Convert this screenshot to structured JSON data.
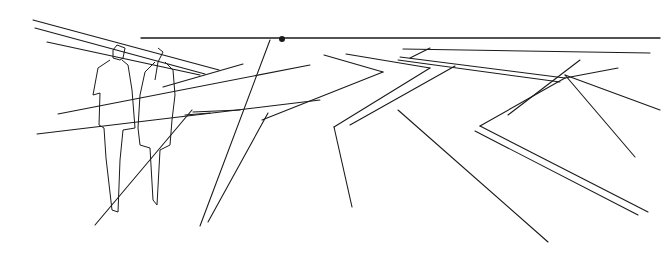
{
  "sketch": {
    "width": 671,
    "height": 262,
    "stroke_color": "#1a1a1a",
    "horizon": {
      "x1": 141,
      "y1": 38,
      "x2": 660,
      "y2": 38,
      "vanishing_point": {
        "cx": 282,
        "cy": 39,
        "r": 3
      }
    },
    "lines": [
      [
        33,
        20,
        219,
        70
      ],
      [
        35,
        28,
        205,
        74
      ],
      [
        47,
        42,
        200,
        75
      ],
      [
        58,
        114,
        310,
        65
      ],
      [
        37,
        134,
        320,
        100
      ],
      [
        95,
        225,
        192,
        110
      ],
      [
        193,
        112,
        240,
        110
      ],
      [
        185,
        115,
        210,
        113
      ],
      [
        270,
        40,
        200,
        226
      ],
      [
        243,
        64,
        163,
        87
      ],
      [
        288,
        68,
        0,
        0
      ],
      [
        307,
        64,
        0,
        0
      ],
      [
        324,
        55,
        383,
        72
      ],
      [
        383,
        72,
        262,
        120
      ],
      [
        346,
        54,
        430,
        68
      ],
      [
        430,
        68,
        334,
        127
      ],
      [
        334,
        127,
        352,
        207
      ],
      [
        268,
        113,
        208,
        222
      ],
      [
        403,
        49,
        650,
        53
      ],
      [
        400,
        57,
        565,
        78
      ],
      [
        398,
        60,
        560,
        82
      ],
      [
        410,
        58,
        430,
        48
      ],
      [
        565,
        78,
        618,
        68
      ],
      [
        565,
        75,
        635,
        157
      ],
      [
        565,
        75,
        660,
        110
      ],
      [
        565,
        78,
        480,
        126
      ],
      [
        480,
        126,
        648,
        212
      ],
      [
        475,
        131,
        638,
        215
      ],
      [
        455,
        66,
        350,
        125
      ],
      [
        398,
        110,
        548,
        242
      ],
      [
        580,
        60,
        508,
        115
      ]
    ],
    "figures": [
      {
        "name": "man",
        "path": "M117,45 L125,48 L123,58 L120,60 L113,58 L113,50 Z M110,60 L98,68 L93,95 L100,93 L99,125 L104,128 L106,158 L112,210 L118,212 L120,160 L123,130 L135,128 L132,90 L128,65 L122,60"
      },
      {
        "name": "woman",
        "path": "M158,48 L163,52 L158,62 L155,80 M155,62 L145,72 L140,95 L138,128 L140,145 L150,148 L153,200 L157,205 L160,150 L170,145 L172,120 L175,95 L173,70 L165,62"
      }
    ]
  }
}
